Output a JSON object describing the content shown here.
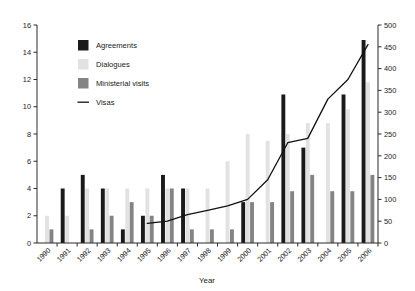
{
  "chart_data": {
    "type": "bar",
    "title": "",
    "xlabel": "Year",
    "ylabel": "",
    "ylim": [
      0,
      16
    ],
    "y2lim": [
      0,
      500
    ],
    "grid": false,
    "legend_position": "upper-left-inside",
    "categories": [
      "1990",
      "1991",
      "1992",
      "1993",
      "1994",
      "1995",
      "1996",
      "1997",
      "1998",
      "1999",
      "2000",
      "2001",
      "2002",
      "2003",
      "2004",
      "2005",
      "2006"
    ],
    "yticks": [
      0,
      2,
      4,
      6,
      8,
      10,
      12,
      14,
      16
    ],
    "y2ticks": [
      0,
      50,
      100,
      150,
      200,
      250,
      300,
      350,
      400,
      450,
      500
    ],
    "series": [
      {
        "name": "Agreements",
        "kind": "bar",
        "axis": "left",
        "color": "#1a1a1a",
        "values": [
          0,
          4,
          5,
          4,
          1,
          2,
          5,
          4,
          0,
          0,
          3,
          0,
          10.9,
          7,
          0,
          10.9,
          14.9
        ]
      },
      {
        "name": "Dialogues",
        "kind": "bar",
        "axis": "left",
        "color": "#e2e2e2",
        "values": [
          2,
          2,
          4,
          4,
          4,
          4,
          4,
          4,
          4,
          6,
          8,
          7.5,
          8,
          8.8,
          8.8,
          9.8,
          11.8
        ]
      },
      {
        "name": "Ministerial visits",
        "kind": "bar",
        "axis": "left",
        "color": "#848484",
        "values": [
          1,
          0,
          1,
          2,
          3,
          2,
          4,
          1,
          1,
          1,
          3,
          3,
          3.8,
          5,
          3.8,
          3.8,
          5
        ]
      },
      {
        "name": "Visas",
        "kind": "line",
        "axis": "right",
        "color": "#111111",
        "values": [
          null,
          null,
          null,
          null,
          null,
          45,
          50,
          65,
          75,
          85,
          100,
          145,
          230,
          240,
          330,
          375,
          455
        ]
      }
    ],
    "legend": [
      {
        "label": "Agreements",
        "marker": "square",
        "color": "#1a1a1a"
      },
      {
        "label": "Dialogues",
        "marker": "square",
        "color": "#e2e2e2"
      },
      {
        "label": "Ministerial visits",
        "marker": "square",
        "color": "#848484"
      },
      {
        "label": "Visas",
        "marker": "line",
        "color": "#111111"
      }
    ]
  }
}
